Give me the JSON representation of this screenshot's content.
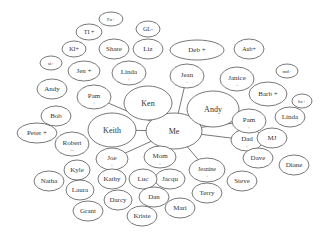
{
  "diagram": {
    "title": "",
    "center": "Me",
    "nodes": [
      {
        "id": "me",
        "label": "Me",
        "sub": "",
        "cx": 174,
        "cy": 131,
        "rx": 28,
        "ry": 18,
        "fs": 8
      },
      {
        "id": "ken",
        "label": "Ken",
        "sub": "",
        "cx": 148,
        "cy": 103,
        "rx": 24,
        "ry": 17,
        "fs": 8
      },
      {
        "id": "keith",
        "label": "Keith",
        "sub": "",
        "cx": 112,
        "cy": 130,
        "rx": 24,
        "ry": 17,
        "fs": 8
      },
      {
        "id": "andy-big",
        "label": "Andy",
        "sub": "",
        "cx": 213,
        "cy": 109,
        "rx": 26,
        "ry": 18,
        "fs": 8
      },
      {
        "id": "jean",
        "label": "Jean",
        "sub": "-",
        "cx": 187,
        "cy": 76,
        "rx": 17,
        "ry": 12,
        "fs": 7
      },
      {
        "id": "janice",
        "label": "Janice",
        "sub": "-",
        "cx": 237,
        "cy": 79,
        "rx": 17,
        "ry": 12,
        "fs": 7
      },
      {
        "id": "dad",
        "label": "Dad",
        "sub": "+",
        "cx": 247,
        "cy": 140,
        "rx": 16,
        "ry": 11,
        "fs": 7
      },
      {
        "id": "mom",
        "label": "Mom",
        "sub": "+",
        "cx": 160,
        "cy": 157,
        "rx": 16,
        "ry": 11,
        "fs": 7
      },
      {
        "id": "joe",
        "label": "Joe",
        "sub": "+",
        "cx": 112,
        "cy": 159,
        "rx": 16,
        "ry": 11,
        "fs": 7
      },
      {
        "id": "jeanine",
        "label": "Jeanine",
        "sub": "+",
        "cx": 207,
        "cy": 170,
        "rx": 18,
        "ry": 12,
        "fs": 6
      },
      {
        "id": "pam-left",
        "label": "Pam",
        "sub": "+",
        "cx": 94,
        "cy": 97,
        "rx": 17,
        "ry": 12,
        "fs": 7
      },
      {
        "id": "pam-right",
        "label": "Pam",
        "sub": "+",
        "cx": 249,
        "cy": 121,
        "rx": 17,
        "ry": 12,
        "fs": 7
      },
      {
        "id": "linda-top",
        "label": "Linda",
        "sub": "+",
        "cx": 129,
        "cy": 73,
        "rx": 17,
        "ry": 12,
        "fs": 7
      },
      {
        "id": "deb",
        "label": "Deb +",
        "sub": "",
        "cx": 197,
        "cy": 50,
        "rx": 27,
        "ry": 10,
        "fs": 7
      },
      {
        "id": "aub",
        "label": "Aub+",
        "sub": "",
        "cx": 249,
        "cy": 49,
        "rx": 15,
        "ry": 10,
        "fs": 6
      },
      {
        "id": "md",
        "label": "md+",
        "sub": "",
        "cx": 287,
        "cy": 71,
        "rx": 11,
        "ry": 7,
        "fs": 5
      },
      {
        "id": "barb",
        "label": "Barb +",
        "sub": "",
        "cx": 268,
        "cy": 94,
        "rx": 19,
        "ry": 12,
        "fs": 7
      },
      {
        "id": "hv",
        "label": "hv+",
        "sub": "",
        "cx": 302,
        "cy": 101,
        "rx": 10,
        "ry": 7,
        "fs": 5
      },
      {
        "id": "linda-right",
        "label": "Linda",
        "sub": "",
        "cx": 290,
        "cy": 117,
        "rx": 15,
        "ry": 10,
        "fs": 7
      },
      {
        "id": "mj",
        "label": "MJ",
        "sub": "",
        "cx": 272,
        "cy": 138,
        "rx": 15,
        "ry": 10,
        "fs": 7
      },
      {
        "id": "dave",
        "label": "Dave",
        "sub": "",
        "cx": 258,
        "cy": 158,
        "rx": 15,
        "ry": 10,
        "fs": 7
      },
      {
        "id": "diane",
        "label": "Diane",
        "sub": "",
        "cx": 294,
        "cy": 165,
        "rx": 15,
        "ry": 10,
        "fs": 7
      },
      {
        "id": "steve",
        "label": "Steve",
        "sub": "",
        "cx": 242,
        "cy": 181,
        "rx": 15,
        "ry": 10,
        "fs": 7
      },
      {
        "id": "terry",
        "label": "Terry",
        "sub": "",
        "cx": 207,
        "cy": 193,
        "rx": 15,
        "ry": 10,
        "fs": 7
      },
      {
        "id": "jacqu",
        "label": "Jacqu",
        "sub": "",
        "cx": 170,
        "cy": 179,
        "rx": 15,
        "ry": 10,
        "fs": 7
      },
      {
        "id": "luc",
        "label": "Luc",
        "sub": "",
        "cx": 143,
        "cy": 179,
        "rx": 14,
        "ry": 10,
        "fs": 7
      },
      {
        "id": "kathy",
        "label": "Kathy",
        "sub": "",
        "cx": 112,
        "cy": 179,
        "rx": 14,
        "ry": 10,
        "fs": 7
      },
      {
        "id": "dan",
        "label": "Dan",
        "sub": "",
        "cx": 154,
        "cy": 197,
        "rx": 15,
        "ry": 10,
        "fs": 7
      },
      {
        "id": "mari",
        "label": "Mari",
        "sub": "",
        "cx": 180,
        "cy": 208,
        "rx": 15,
        "ry": 10,
        "fs": 7
      },
      {
        "id": "kriste",
        "label": "Kriste",
        "sub": "",
        "cx": 142,
        "cy": 216,
        "rx": 15,
        "ry": 10,
        "fs": 7
      },
      {
        "id": "darcy",
        "label": "Darcy",
        "sub": "",
        "cx": 118,
        "cy": 200,
        "rx": 14,
        "ry": 10,
        "fs": 7
      },
      {
        "id": "grant",
        "label": "Grant",
        "sub": "",
        "cx": 88,
        "cy": 211,
        "rx": 15,
        "ry": 10,
        "fs": 7
      },
      {
        "id": "laura",
        "label": "Laura",
        "sub": "",
        "cx": 80,
        "cy": 190,
        "rx": 14,
        "ry": 10,
        "fs": 7
      },
      {
        "id": "kyle",
        "label": "Kyle",
        "sub": "",
        "cx": 77,
        "cy": 170,
        "rx": 13,
        "ry": 10,
        "fs": 7
      },
      {
        "id": "natha",
        "label": "Natha",
        "sub": "",
        "cx": 49,
        "cy": 181,
        "rx": 15,
        "ry": 10,
        "fs": 7
      },
      {
        "id": "robert",
        "label": "Robert",
        "sub": "--",
        "cx": 72,
        "cy": 144,
        "rx": 17,
        "ry": 12,
        "fs": 7
      },
      {
        "id": "peter",
        "label": "Peter +",
        "sub": "",
        "cx": 37,
        "cy": 133,
        "rx": 20,
        "ry": 10,
        "fs": 7
      },
      {
        "id": "bob",
        "label": "Bob",
        "sub": "",
        "cx": 56,
        "cy": 116,
        "rx": 15,
        "ry": 10,
        "fs": 7
      },
      {
        "id": "andy-small",
        "label": "Andy",
        "sub": "",
        "cx": 52,
        "cy": 89,
        "rx": 15,
        "ry": 10,
        "fs": 7
      },
      {
        "id": "si",
        "label": "si+",
        "sub": "",
        "cx": 51,
        "cy": 63,
        "rx": 11,
        "ry": 7,
        "fs": 5
      },
      {
        "id": "jen",
        "label": "Jen +",
        "sub": "",
        "cx": 84,
        "cy": 71,
        "rx": 16,
        "ry": 10,
        "fs": 7
      },
      {
        "id": "ki",
        "label": "KI+",
        "sub": "",
        "cx": 74,
        "cy": 49,
        "rx": 12,
        "ry": 8,
        "fs": 6
      },
      {
        "id": "share",
        "label": "Share",
        "sub": "",
        "cx": 114,
        "cy": 49,
        "rx": 15,
        "ry": 10,
        "fs": 7
      },
      {
        "id": "tl",
        "label": "TI +",
        "sub": "",
        "cx": 89,
        "cy": 32,
        "rx": 13,
        "ry": 8,
        "fs": 6
      },
      {
        "id": "fa",
        "label": "Fa+",
        "sub": "",
        "cx": 111,
        "cy": 19,
        "rx": 12,
        "ry": 7,
        "fs": 5
      },
      {
        "id": "gl",
        "label": "GL-",
        "sub": "",
        "cx": 148,
        "cy": 29,
        "rx": 12,
        "ry": 8,
        "fs": 6
      },
      {
        "id": "liz",
        "label": "Liz",
        "sub": "",
        "cx": 148,
        "cy": 49,
        "rx": 15,
        "ry": 10,
        "fs": 7
      }
    ],
    "edges": [
      [
        "me",
        "ken"
      ],
      [
        "me",
        "keith"
      ],
      [
        "me",
        "andy-big"
      ],
      [
        "me",
        "jean"
      ],
      [
        "me",
        "dad"
      ],
      [
        "me",
        "mom"
      ],
      [
        "me",
        "joe"
      ],
      [
        "me",
        "jeanine"
      ],
      [
        "me",
        "pam-left"
      ],
      [
        "me",
        "pam-right"
      ]
    ],
    "colors": {
      "stroke": "#555555",
      "text": "#333333",
      "background": "#ffffff"
    }
  }
}
